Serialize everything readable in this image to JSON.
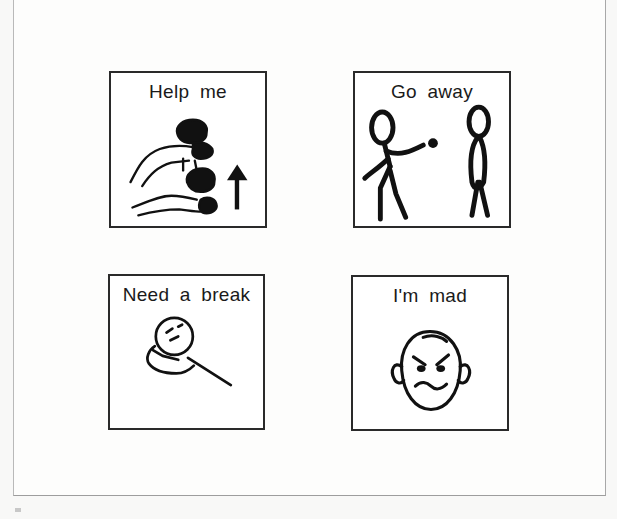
{
  "document": {
    "type": "picture-communication-board",
    "cards": [
      {
        "label": "Help me",
        "icon": "helping-hands-icon"
      },
      {
        "label": "Go away",
        "icon": "two-people-go-away-icon"
      },
      {
        "label": "Need a break",
        "icon": "resting-head-icon"
      },
      {
        "label": "I'm mad",
        "icon": "angry-face-icon"
      }
    ]
  },
  "colors": {
    "background": "#fdfdfc",
    "card_border": "#2a2a2a",
    "ink": "#1a1a1a",
    "frame_border": "#a8a8a8"
  }
}
